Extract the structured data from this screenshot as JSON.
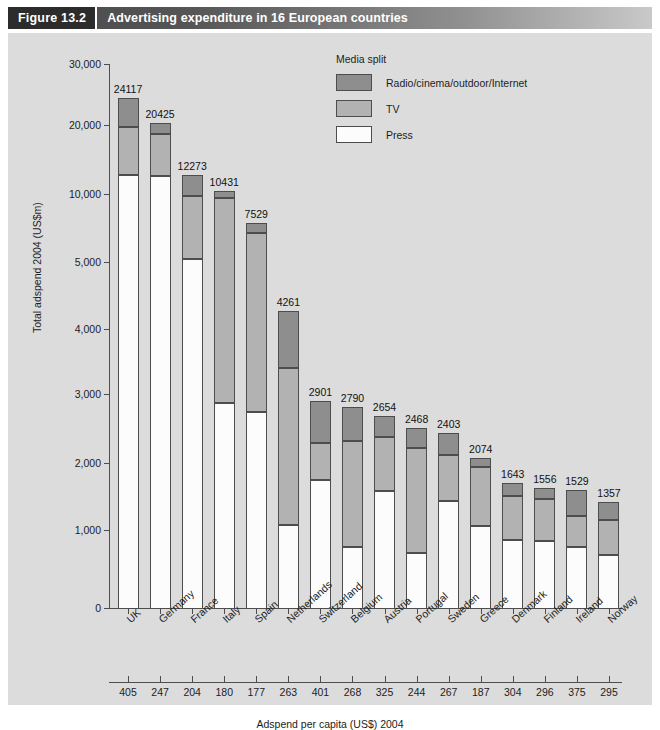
{
  "figure": {
    "number": "Figure 13.2",
    "title": "Advertising expenditure in 16 European countries"
  },
  "legend": {
    "title": "Media split",
    "items": [
      {
        "label": "Radio/cinema/outdoor/Internet",
        "color": "#8e8e8e",
        "key": "radio"
      },
      {
        "label": "TV",
        "color": "#b2b2b2",
        "key": "tv"
      },
      {
        "label": "Press",
        "color": "#fcfcfc",
        "key": "press"
      }
    ]
  },
  "axis2": {
    "title": "Adspend per capita (US$) 2004"
  },
  "chart_data": {
    "type": "bar",
    "subtype": "stacked-bar",
    "title": "Advertising expenditure in 16 European countries",
    "xlabel": "",
    "ylabel": "Total adspend 2004 (US$m)",
    "yscale": "log",
    "ylim": [
      0,
      30000
    ],
    "grid": false,
    "legend_position": "top-right",
    "yticks": [
      0,
      1000,
      2000,
      3000,
      4000,
      5000,
      10000,
      20000,
      30000
    ],
    "ytick_labels": [
      "0",
      "1,000",
      "2,000",
      "3,000",
      "4,000",
      "5,000",
      "10,000",
      "20,000",
      "30,000"
    ],
    "categories": [
      "UK",
      "Germany",
      "France",
      "Italy",
      "Spain",
      "Netherlands",
      "Switzerland",
      "Belgium",
      "Austria",
      "Portugal",
      "Sweden",
      "Greece",
      "Denmark",
      "Finland",
      "Ireland",
      "Norway"
    ],
    "totals": [
      24117,
      20425,
      12273,
      10431,
      7529,
      4261,
      2901,
      2790,
      2654,
      2468,
      2403,
      2074,
      1643,
      1556,
      1529,
      1357
    ],
    "series": [
      {
        "name": "Press",
        "color": "#fcfcfc",
        "values": [
          12200,
          12100,
          5200,
          2870,
          2720,
          1060,
          1700,
          790,
          1510,
          720,
          1370,
          1050,
          880,
          870,
          800,
          690
        ]
      },
      {
        "name": "TV",
        "color": "#b2b2b2",
        "values": [
          7700,
          6300,
          4700,
          6790,
          4100,
          2320,
          560,
          1500,
          830,
          1480,
          740,
          890,
          550,
          520,
          370,
          430
        ]
      },
      {
        "name": "Radio/cinema/outdoor/Internet",
        "color": "#8e8e8e",
        "values": [
          4217,
          2025,
          2373,
          771,
          709,
          881,
          641,
          500,
          314,
          268,
          293,
          134,
          213,
          166,
          359,
          237
        ]
      }
    ],
    "secondary_axis": {
      "label": "Adspend per capita (US$) 2004",
      "values": [
        405,
        247,
        204,
        180,
        177,
        263,
        401,
        268,
        325,
        244,
        267,
        187,
        304,
        296,
        375,
        295
      ]
    }
  }
}
